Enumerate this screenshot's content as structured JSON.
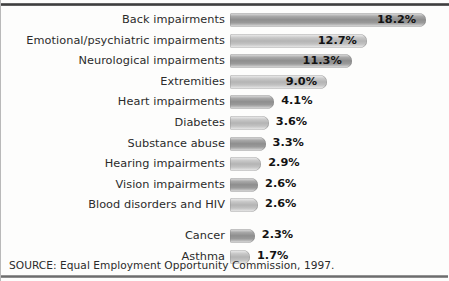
{
  "chart_data": {
    "type": "bar",
    "orientation": "horizontal",
    "title": "",
    "subtitle": "",
    "xlabel": "",
    "ylabel": "",
    "grid": false,
    "legend": null,
    "value_suffix": "%",
    "xlim": [
      0,
      18.2
    ],
    "categories": [
      "Back impairments",
      "Emotional/psychiatric impairments",
      "Neurological impairments",
      "Extremities",
      "Heart impairments",
      "Diabetes",
      "Substance abuse",
      "Hearing impairments",
      "Vision impairments",
      "Blood disorders and HIV",
      "Cancer",
      "Asthma"
    ],
    "values": [
      18.2,
      12.7,
      11.3,
      9.0,
      4.1,
      3.6,
      3.3,
      2.9,
      2.6,
      2.6,
      2.3,
      1.7
    ],
    "value_labels": [
      "18.2%",
      "12.7%",
      "11.3%",
      "9.0%",
      "4.1%",
      "3.6%",
      "3.3%",
      "2.9%",
      "2.6%",
      "2.6%",
      "2.3%",
      "1.7%"
    ],
    "label_placement": [
      "inside",
      "inside",
      "inside",
      "inside",
      "outside",
      "outside",
      "outside",
      "outside",
      "outside",
      "outside",
      "outside",
      "outside"
    ],
    "bar_shade": [
      "dark",
      "light",
      "dark",
      "light",
      "dark",
      "light",
      "dark",
      "light",
      "dark",
      "light",
      "dark",
      "light"
    ]
  },
  "source": {
    "text": "SOURCE: Equal Employment Opportunity Commission, 1997."
  },
  "colors": {
    "bar_dark_mid": "#8e8e8e",
    "bar_light_mid": "#b4b4b4",
    "text": "#2b2b2b",
    "value_text": "#131313",
    "rule_top": "#3a3a3a",
    "rule_bottom": "#6d6d6d",
    "background": "#fdfdfc"
  }
}
